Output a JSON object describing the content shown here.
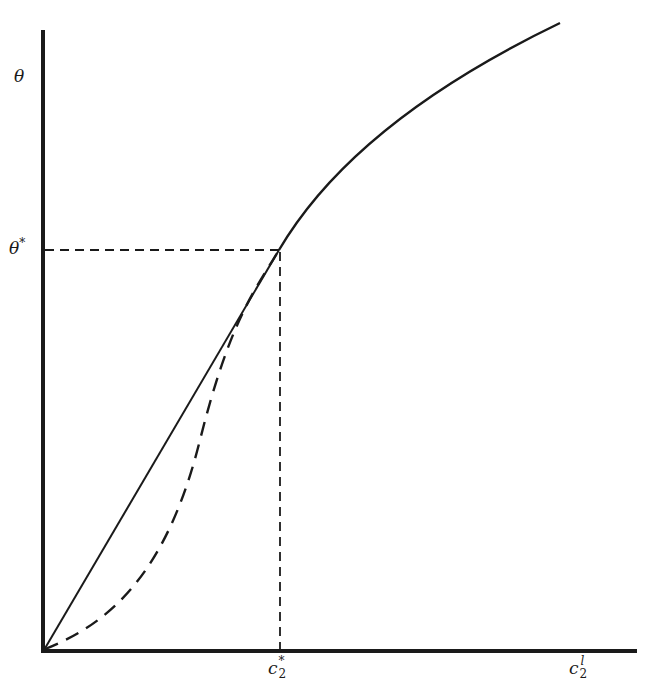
{
  "figure": {
    "type": "diagram",
    "colors": {
      "ink": "#1a1a1a",
      "background": "#ffffff"
    },
    "axes": {
      "y_label": "θ",
      "x_ticks": [
        {
          "base": "c",
          "subscript": "2",
          "superscript": "*"
        },
        {
          "base": "c",
          "subscript": "2",
          "superscript": "l"
        }
      ],
      "y_ticks": [
        {
          "base": "θ",
          "superscript": "*"
        }
      ]
    },
    "curves": [
      {
        "name": "solid-linear-segment",
        "style": "solid",
        "description": "straight line from origin to (c2*, θ*)"
      },
      {
        "name": "solid-concave-curve",
        "style": "solid",
        "description": "concave curve from (c2*, θ*) rising toward c2^l"
      },
      {
        "name": "dashed-convex-curve",
        "style": "dashed",
        "description": "convex curve from origin to (c2*, θ*)"
      }
    ],
    "guides": [
      {
        "name": "theta-star-guide",
        "style": "dashed",
        "orientation": "horizontal"
      },
      {
        "name": "c2-star-guide",
        "style": "dashed",
        "orientation": "vertical"
      }
    ]
  }
}
